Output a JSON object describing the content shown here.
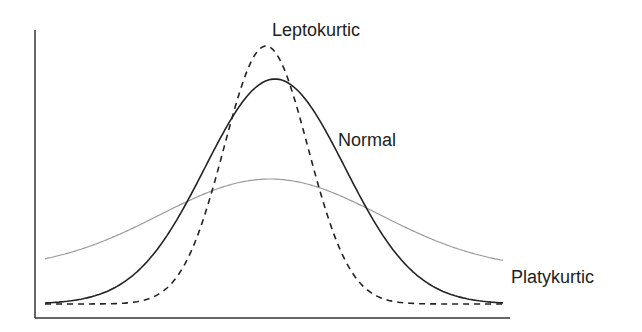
{
  "chart_data": {
    "type": "line",
    "title": "",
    "xlabel": "",
    "ylabel": "",
    "grid": false,
    "legend": "inline labels",
    "axes": {
      "x_ticks": [],
      "y_ticks": []
    },
    "series": [
      {
        "name": "Leptokurtic",
        "style": "dashed",
        "color": "#222222",
        "center_px": 266,
        "peak_px": 46,
        "base_px": 304,
        "width_px": 42,
        "label": {
          "text": "Leptokurtic",
          "x": 272,
          "y": 20
        }
      },
      {
        "name": "Normal",
        "style": "solid",
        "color": "#222222",
        "center_px": 275,
        "peak_px": 79,
        "base_px": 304,
        "width_px": 70,
        "label": {
          "text": "Normal",
          "x": 338,
          "y": 131
        }
      },
      {
        "name": "Platykurtic",
        "style": "dotted-thin",
        "color": "#999999",
        "center_px": 270,
        "peak_px": 179,
        "base_px": 270,
        "width_px": 110,
        "label": {
          "text": "Platykurtic",
          "x": 511,
          "y": 268
        }
      }
    ],
    "x_range_px": [
      45,
      503
    ]
  },
  "labels": {
    "leptokurtic": "Leptokurtic",
    "normal": "Normal",
    "platykurtic": "Platykurtic"
  }
}
